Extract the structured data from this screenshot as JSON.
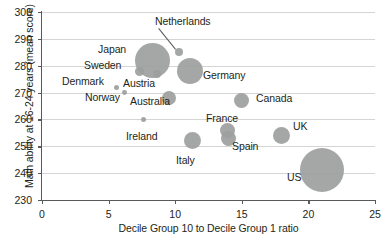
{
  "chart_data": {
    "type": "scatter",
    "title": "",
    "xlabel": "Decile Group 10 to Decile Group 1 ratio",
    "ylabel": "Math ability at 16-24 years (mean score)",
    "xlim": [
      0,
      25
    ],
    "ylim": [
      230,
      300
    ],
    "xticks": [
      0,
      5,
      10,
      15,
      20,
      25
    ],
    "yticks": [
      230,
      240,
      250,
      260,
      270,
      280,
      290,
      300
    ],
    "grid": "horizontal",
    "legend": "none",
    "bubble_color": "#9d9e9e",
    "points": [
      {
        "label": "Japan",
        "x": 8.3,
        "y": 282,
        "size": 17.5
      },
      {
        "label": "Netherlands",
        "x": 10.3,
        "y": 285,
        "size": 4.0
      },
      {
        "label": "Sweden",
        "x": 7.3,
        "y": 278,
        "size": 4.5
      },
      {
        "label": "Austria",
        "x": 8.6,
        "y": 277,
        "size": 4.0
      },
      {
        "label": "Denmark",
        "x": 5.6,
        "y": 272,
        "size": 2.6
      },
      {
        "label": "Norway",
        "x": 6.2,
        "y": 270,
        "size": 2.4
      },
      {
        "label": "Germany",
        "x": 11.1,
        "y": 278,
        "size": 13.0
      },
      {
        "label": "Australia",
        "x": 9.5,
        "y": 268,
        "size": 7.0
      },
      {
        "label": "Canada",
        "x": 15.0,
        "y": 267,
        "size": 7.5
      },
      {
        "label": "Ireland",
        "x": 7.6,
        "y": 260,
        "size": 2.6
      },
      {
        "label": "France",
        "x": 13.9,
        "y": 256,
        "size": 7.5
      },
      {
        "label": "UK",
        "x": 18.0,
        "y": 254,
        "size": 8.5
      },
      {
        "label": "Spain",
        "x": 14.0,
        "y": 253,
        "size": 7.5
      },
      {
        "label": "Italy",
        "x": 11.3,
        "y": 252,
        "size": 8.5
      },
      {
        "label": "US",
        "x": 21.0,
        "y": 241,
        "size": 22.0
      }
    ],
    "labels": [
      {
        "text": "Netherlands",
        "left": 155,
        "top": 16,
        "leader": true
      },
      {
        "text": "Japan",
        "left": 98,
        "top": 44
      },
      {
        "text": "Sweden",
        "left": 84,
        "top": 60
      },
      {
        "text": "Denmark",
        "left": 62,
        "top": 76
      },
      {
        "text": "Austria",
        "left": 123,
        "top": 78
      },
      {
        "text": "Norway",
        "left": 85,
        "top": 92
      },
      {
        "text": "Germany",
        "left": 203,
        "top": 70
      },
      {
        "text": "Australia",
        "left": 130,
        "top": 96
      },
      {
        "text": "Canada",
        "left": 256,
        "top": 93
      },
      {
        "text": "Ireland",
        "left": 126,
        "top": 131
      },
      {
        "text": "France",
        "left": 206,
        "top": 113
      },
      {
        "text": "UK",
        "left": 293,
        "top": 121
      },
      {
        "text": "Spain",
        "left": 232,
        "top": 141
      },
      {
        "text": "Italy",
        "left": 176,
        "top": 155
      },
      {
        "text": "US",
        "left": 287,
        "top": 172
      }
    ]
  }
}
